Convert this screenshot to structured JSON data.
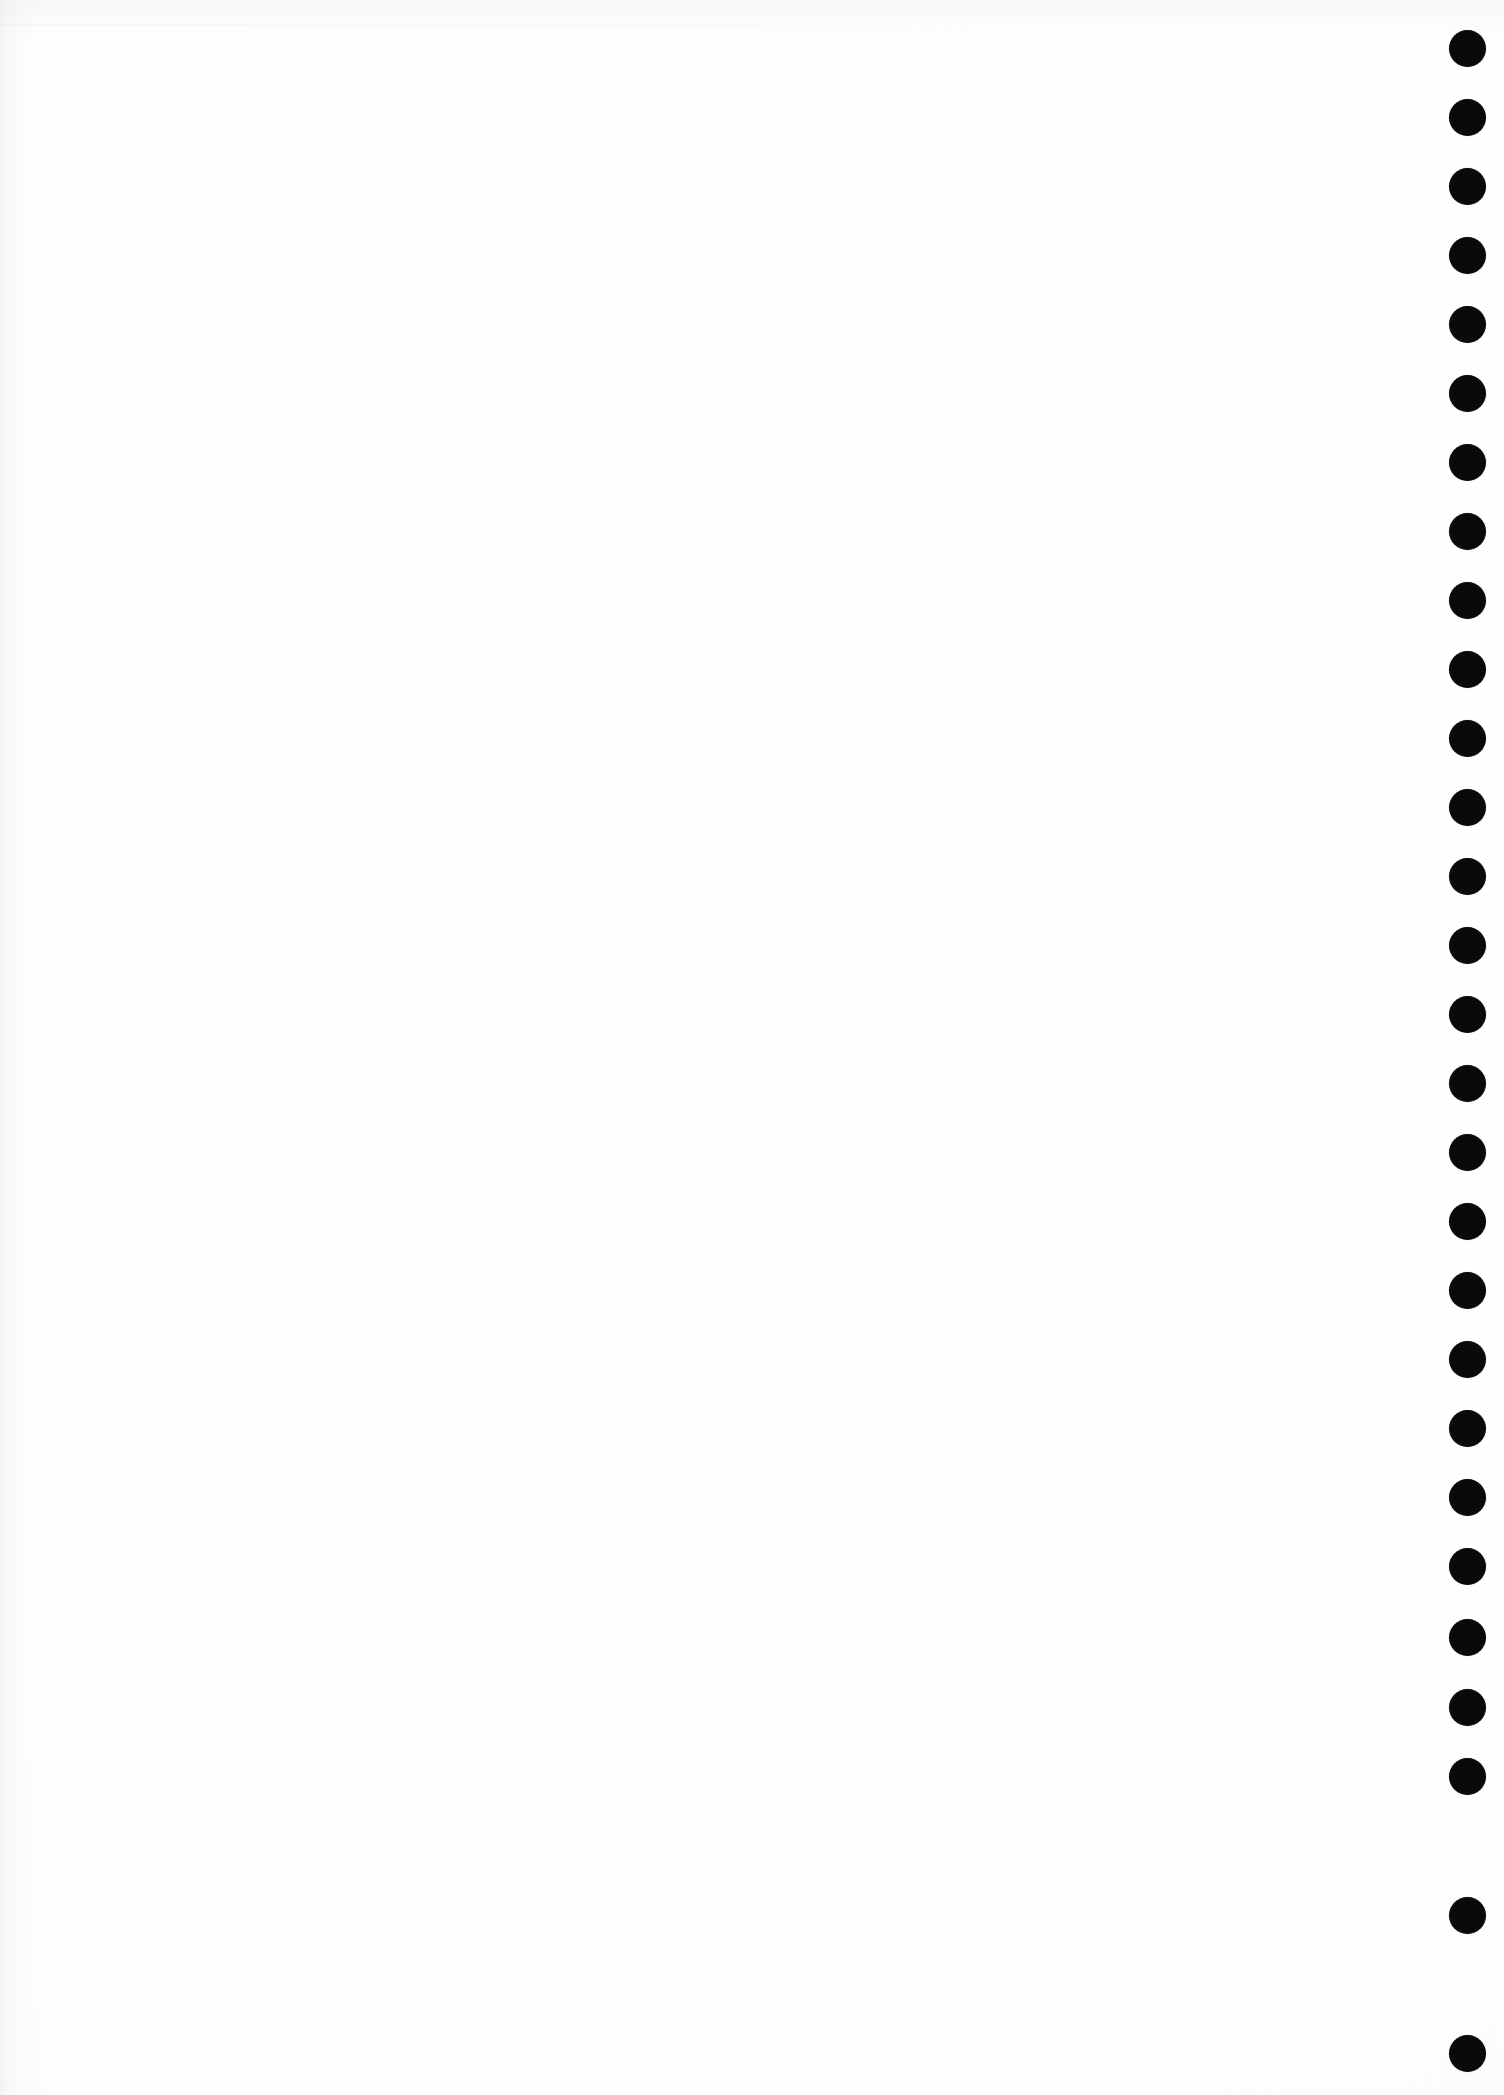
{
  "document": {
    "kind": "scanned-page",
    "page_label": "",
    "body_text": "",
    "has_printed_content": false,
    "background_color": "#ffffff"
  },
  "page": {
    "width": 1504,
    "height": 2095
  },
  "binding_marks": {
    "name": "binding-dot-column",
    "description": "vertical column of solid black punched dots along the right edge",
    "count": 28,
    "color": "#0a0a0a",
    "diameter": 37,
    "center_x": 1467,
    "first_center_y": 48,
    "spacing_y": 69,
    "dots": [
      {
        "index": 1,
        "cy": 48
      },
      {
        "index": 2,
        "cy": 117
      },
      {
        "index": 3,
        "cy": 186
      },
      {
        "index": 4,
        "cy": 255
      },
      {
        "index": 5,
        "cy": 324
      },
      {
        "index": 6,
        "cy": 393
      },
      {
        "index": 7,
        "cy": 462
      },
      {
        "index": 8,
        "cy": 531
      },
      {
        "index": 9,
        "cy": 600
      },
      {
        "index": 10,
        "cy": 669
      },
      {
        "index": 11,
        "cy": 738
      },
      {
        "index": 12,
        "cy": 807
      },
      {
        "index": 13,
        "cy": 876
      },
      {
        "index": 14,
        "cy": 945
      },
      {
        "index": 15,
        "cy": 1014
      },
      {
        "index": 16,
        "cy": 1083
      },
      {
        "index": 17,
        "cy": 1152
      },
      {
        "index": 18,
        "cy": 1221
      },
      {
        "index": 19,
        "cy": 1290
      },
      {
        "index": 20,
        "cy": 1359
      },
      {
        "index": 21,
        "cy": 1428
      },
      {
        "index": 22,
        "cy": 1497
      },
      {
        "index": 23,
        "cy": 1566
      },
      {
        "index": 24,
        "cy": 1637
      },
      {
        "index": 25,
        "cy": 1707
      },
      {
        "index": 26,
        "cy": 1776
      },
      {
        "index": 27,
        "cy": 1915
      },
      {
        "index": 28,
        "cy": 2053
      }
    ]
  },
  "artifacts": {
    "scan_streak_visible": true,
    "grain_visible": true,
    "left_edge_shadow_visible": true
  }
}
